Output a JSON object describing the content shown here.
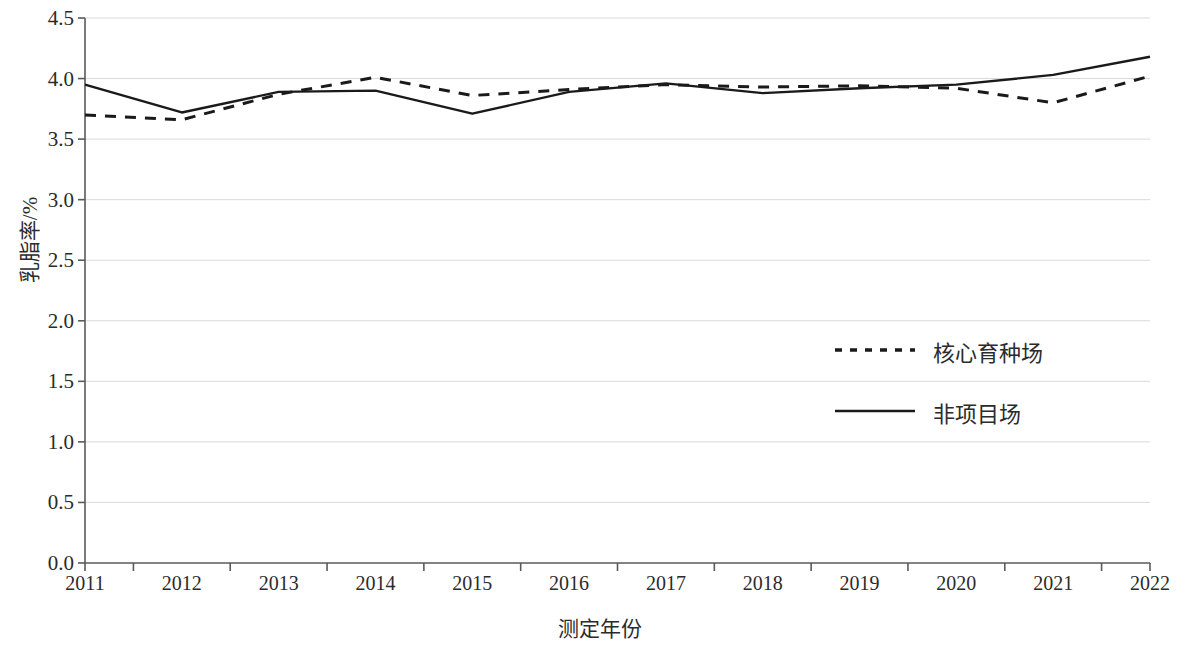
{
  "chart_data": {
    "type": "line",
    "title": "",
    "xlabel": "测定年份",
    "ylabel": "乳脂率/%",
    "categories": [
      "2011",
      "2012",
      "2013",
      "2014",
      "2015",
      "2016",
      "2017",
      "2018",
      "2019",
      "2020",
      "2021",
      "2022"
    ],
    "x": [
      2011,
      2012,
      2013,
      2014,
      2015,
      2016,
      2017,
      2018,
      2019,
      2020,
      2021,
      2022
    ],
    "xlim": [
      2011,
      2022
    ],
    "ylim": [
      0.0,
      4.5
    ],
    "yticks": [
      "0.0",
      "0.5",
      "1.0",
      "1.5",
      "2.0",
      "2.5",
      "3.0",
      "3.5",
      "4.0",
      "4.5"
    ],
    "ytick_values": [
      0.0,
      0.5,
      1.0,
      1.5,
      2.0,
      2.5,
      3.0,
      3.5,
      4.0,
      4.5
    ],
    "grid": true,
    "grid_axis": "y",
    "legend_position": "center-right",
    "series": [
      {
        "name": "核心育种场",
        "style": "dashed",
        "color": "#1a1a1a",
        "values": [
          3.7,
          3.66,
          3.87,
          4.01,
          3.86,
          3.91,
          3.95,
          3.93,
          3.94,
          3.92,
          3.8,
          4.02
        ]
      },
      {
        "name": "非项目场",
        "style": "solid",
        "color": "#1a1a1a",
        "values": [
          3.95,
          3.72,
          3.89,
          3.9,
          3.71,
          3.89,
          3.96,
          3.88,
          3.92,
          3.95,
          4.03,
          4.18
        ]
      }
    ]
  },
  "legend": {
    "items": [
      {
        "label": "核心育种场",
        "style": "dashed"
      },
      {
        "label": "非项目场",
        "style": "solid"
      }
    ]
  },
  "axes": {
    "y_title": "乳脂率/%",
    "x_title": "测定年份"
  }
}
